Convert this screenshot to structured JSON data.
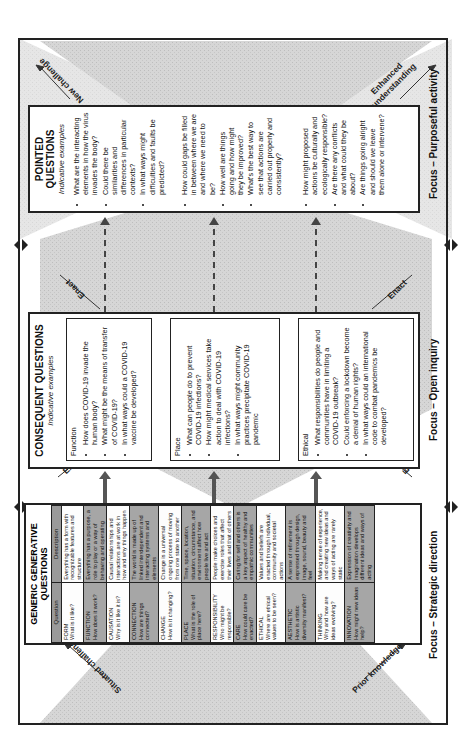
{
  "diagram": {
    "focus_labels": {
      "strategic": "Focus – Strategic direction",
      "open": "Focus – Open inquiry",
      "purposeful": "Focus – Purposeful activity"
    },
    "flow_labels": {
      "situated_challenge": "Situated challenge",
      "prior_knowledge": "Prior knowledge",
      "expand_top": "Expand",
      "expand_bottom": "Expand",
      "enact_top": "Enact",
      "enact_bottom": "Enact",
      "new_challenge": "New challenge",
      "enhanced_understanding": "Enhanced understanding"
    },
    "generic": {
      "title": "GENERIC GENERATIVE QUESTIONS",
      "headers": [
        "Question",
        "Description"
      ],
      "rows": [
        {
          "name": "FORM",
          "question": "What is it like?",
          "description": "Everything has a form with recognizable features and structure"
        },
        {
          "name": "FUNCTION",
          "question": "How does it work?",
          "description": "Everything has a purpose, a role to play or a way of behaving and operating"
        },
        {
          "name": "CAUSATION",
          "question": "Why is it like it is?",
          "description": "Causal relationships and interactions are at work in how and why things happen"
        },
        {
          "name": "CONNECTION",
          "question": "How are things connected?",
          "description": "The world is made up of linked interdependent and interacting systems and elements"
        },
        {
          "name": "CHANGE",
          "question": "How is it changing?",
          "description": "Change is a universal ongoing process of moving from one state to another"
        },
        {
          "name": "PLACE",
          "question": "What is the role of place here?",
          "description": "Time, space, location, situation, circumstance, and environment affect how people live and act"
        },
        {
          "name": "RESPONSIBILITY",
          "question": "Who might be responsible?",
          "description": "People make choices and exercise roles that affect their lives and that of others"
        },
        {
          "name": "CARE",
          "question": "How could care be enacted?",
          "description": "Caring for self and others is a key aspect of healthy and empathic communities"
        },
        {
          "name": "ETHICAL",
          "question": "Where are ethical values to be seen?",
          "description": "Values and beliefs are enacted through individual, community and societal actions"
        },
        {
          "name": "AESTHETIC",
          "question": "How is artistic diversity manifest?",
          "description": "A sense of refinement is expressed through design, image, sound, beauty and feel"
        },
        {
          "name": "THINKING",
          "question": "Why and how are ideas evolving?",
          "description": "Making sense of experience, and creating new ideas and ways of acting are rarely static"
        },
        {
          "name": "INNOVATION",
          "question": "How might new ideas help?",
          "description": "Expression of creativity and imagination develops different ideas and ways of acting"
        }
      ]
    },
    "consequent": {
      "title": "CONSEQUENT QUESTIONS",
      "subtitle": "Indicative examples",
      "groups": [
        {
          "name": "Function",
          "items": [
            "How does COVID-19 invade the human body?",
            "What might be the means of transfer of COVID-19?",
            "In what ways could a COVID-19 vaccine be developed?"
          ]
        },
        {
          "name": "Place",
          "items": [
            "What can people do to prevent COVID-19 infections?",
            "How might medical services take action to deal with COVID-19 infections?",
            "In what ways might community practices precipitate COVID-19 pandemic"
          ]
        },
        {
          "name": "Ethical",
          "items": [
            "What responsibilities do people and communities have in limiting a COVID-19 outbreak?",
            "Could enforcing a lockdown become a denial of human rights?",
            "In what ways could an international code to combat pandemics be developed?"
          ]
        }
      ]
    },
    "pointed": {
      "title": "POINTED QUESTIONS",
      "subtitle": "Indicative examples",
      "groups": [
        {
          "items": [
            "What are the interacting elements in how the virus invades the body?",
            "Could there be similarities and differences in particular contexts?",
            "In what ways might difficulties and faults be predicted?"
          ]
        },
        {
          "items": [
            "How could gaps be filled in between where we are and where we need to be?",
            "How well are things going and how might they be improved?",
            "What's the best way to see that actions are carried out properly and consistently?"
          ]
        },
        {
          "items": [
            "How might proposed actions be culturally and ecologically responsible?",
            "Are there any conflicts and what could they be about?",
            "Are things going alright and should we leave them alone or intervene?"
          ]
        }
      ]
    }
  }
}
